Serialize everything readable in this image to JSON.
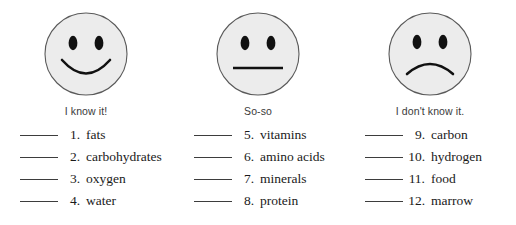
{
  "worksheet": {
    "rating_columns": [
      {
        "face": "smiling-face",
        "caption": "I know it!",
        "items": [
          {
            "number": "1.",
            "label": "fats"
          },
          {
            "number": "2.",
            "label": "carbohydrates"
          },
          {
            "number": "3.",
            "label": "oxygen"
          },
          {
            "number": "4.",
            "label": "water"
          }
        ]
      },
      {
        "face": "neutral-face",
        "caption": "So-so",
        "items": [
          {
            "number": "5.",
            "label": "vitamins"
          },
          {
            "number": "6.",
            "label": "amino acids"
          },
          {
            "number": "7.",
            "label": "minerals"
          },
          {
            "number": "8.",
            "label": "protein"
          }
        ]
      },
      {
        "face": "frowning-face",
        "caption": "I don't know it.",
        "items": [
          {
            "number": "9.",
            "label": "carbon"
          },
          {
            "number": "10.",
            "label": "hydrogen"
          },
          {
            "number": "11.",
            "label": "food"
          },
          {
            "number": "12.",
            "label": "marrow"
          }
        ]
      }
    ],
    "colors": {
      "face_fill": "#ececec",
      "face_outline": "#5a5a5a",
      "feature_ink": "#111111",
      "rule_ink": "#3d3d3d",
      "text_ink": "#1a1a1a",
      "caption_ink": "#3a3a3a",
      "background": "#ffffff"
    }
  }
}
